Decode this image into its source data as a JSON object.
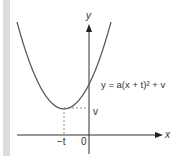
{
  "figure": {
    "type": "parabola graph",
    "equation": "y = a(x + t)² + v",
    "axes": {
      "x_label": "x",
      "y_label": "y",
      "origin_label": "0"
    },
    "vertex": {
      "x_label": "−t",
      "y_label": "v"
    },
    "colors": {
      "curve": "#555555",
      "axes": "#333333",
      "guide_lines": "#777777",
      "side_bar": "#dcdcdc"
    }
  }
}
